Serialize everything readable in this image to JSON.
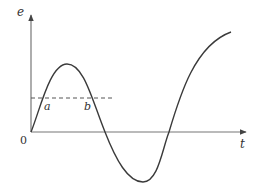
{
  "diagram": {
    "type": "waveform-graph",
    "axes": {
      "y_label": "e",
      "x_label": "t",
      "origin_label": "0"
    },
    "points": {
      "a_label": "a",
      "b_label": "b"
    },
    "reference_line": {
      "style": "dashed",
      "description": "horizontal threshold line intersecting the curve at a and b"
    },
    "curve": {
      "description": "oscillating e(t) curve starting at origin, rising to a peak, dropping below axis to a trough, then rising again"
    },
    "colors": {
      "stroke": "#3a3a3a",
      "axis": "#555555",
      "background": "#ffffff"
    }
  }
}
